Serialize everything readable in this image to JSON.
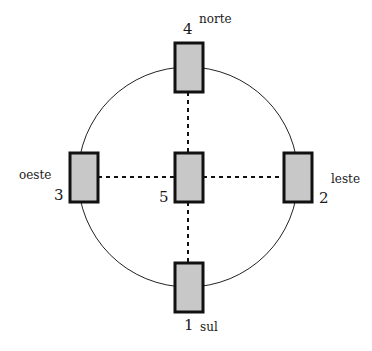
{
  "diagram": {
    "title": "",
    "colors": {
      "card_fill": "#c8c8c8",
      "card_border": "#111111",
      "circle": "#222222",
      "line": "#111111"
    },
    "positions": [
      {
        "number": "1",
        "direction": "sul"
      },
      {
        "number": "2",
        "direction": "leste"
      },
      {
        "number": "3",
        "direction": "oeste"
      },
      {
        "number": "4",
        "direction": "norte"
      },
      {
        "number": "5",
        "direction": ""
      }
    ]
  }
}
